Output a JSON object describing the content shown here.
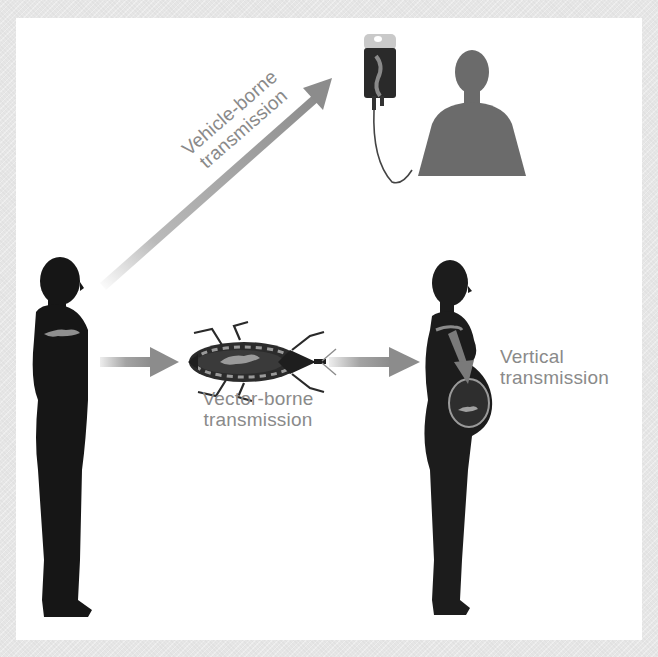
{
  "figure": {
    "background_color": "#ffffff",
    "frame_color": "#e6e6e6",
    "arrow_color": "#8c8c8c",
    "label_color": "#8a8a8a",
    "silhouette_color": "#161616",
    "recipient_color": "#6b6b6b"
  },
  "labels": {
    "vehicle_line1": "Vehicle-borne",
    "vehicle_line2": "transmission",
    "vector_line1": "Vector-borne",
    "vector_line2": "transmission",
    "vertical_line1": "Vertical",
    "vertical_line2": "transmission"
  },
  "elements": {
    "source_person": "infected-person-silhouette",
    "vector": "triatomine-bug",
    "vehicle": "blood-transfusion-bag",
    "recipient": "transfusion-recipient-silhouette",
    "pregnant_person": "pregnant-woman-with-fetus"
  },
  "arrows": [
    {
      "from": "source_person",
      "to": "vehicle",
      "route": "vehicle-borne"
    },
    {
      "from": "source_person",
      "to": "vector",
      "route": "vector-borne"
    },
    {
      "from": "vector",
      "to": "pregnant_person",
      "route": "vector-borne"
    },
    {
      "from": "pregnant_person",
      "to": "fetus",
      "route": "vertical"
    }
  ]
}
